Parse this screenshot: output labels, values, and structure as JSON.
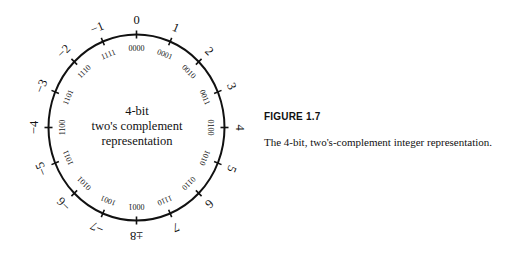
{
  "diagram": {
    "center_text": [
      "4-bit",
      "two's complement",
      "representation"
    ],
    "decimal_labels": [
      "0",
      "1",
      "2",
      "3",
      "4",
      "5",
      "6",
      "7",
      "±8",
      "−7",
      "−6",
      "−5",
      "−4",
      "−3",
      "−2",
      "−1"
    ],
    "binary_labels": [
      "0000",
      "0001",
      "0010",
      "0011",
      "0100",
      "0101",
      "0110",
      "0111",
      "1000",
      "1001",
      "1010",
      "1011",
      "1100",
      "1101",
      "1110",
      "1111"
    ],
    "binary_labels_as_rendered": [
      "0000",
      "0001",
      "0010",
      "0011",
      "0100",
      "1010",
      "0110",
      "1110",
      "0001",
      "1001",
      "0101",
      "1011",
      "1100",
      "1101",
      "1110",
      "1111"
    ],
    "stroke_color": "#111111"
  },
  "figure": {
    "label": "FIGURE 1.7",
    "caption": "The 4-bit, two's-complement integer representation."
  }
}
